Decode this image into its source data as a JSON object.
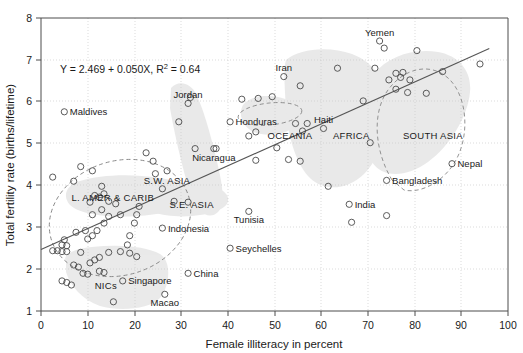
{
  "chart_data": {
    "type": "scatter",
    "title": "",
    "xlabel": "Female illiteracy in percent",
    "ylabel": "Total fertility rate (births/lifetime)",
    "xlim": [
      0,
      100
    ],
    "ylim": [
      1,
      8
    ],
    "xticks": [
      0,
      10,
      20,
      30,
      40,
      50,
      60,
      70,
      80,
      90,
      100
    ],
    "yticks": [
      1,
      2,
      3,
      4,
      5,
      6,
      7,
      8
    ],
    "grid": true,
    "legend_position": "none",
    "annotations": {
      "equation": "Y = 2.469 + 0.050X, R  = 0.64",
      "equation_plain": "Y = 2.469 + 0.050X, R2 = 0.64",
      "equation_lead": "Y = 2.469 + 0.050X, R",
      "equation_sup": "2",
      "equation_tail": " = 0.64"
    },
    "regression": {
      "intercept": 2.469,
      "slope": 0.05,
      "r_squared": 0.64,
      "x_start": 0,
      "x_end": 96
    },
    "cluster_labels": [
      {
        "text": "L. AMER & CARIB",
        "x": 6.5,
        "y": 3.62
      },
      {
        "text": "S.E. ASIA",
        "x": 27.5,
        "y": 3.45
      },
      {
        "text": "S.W. ASIA",
        "x": 22.0,
        "y": 4.03
      },
      {
        "text": "OCEANIA",
        "x": 48.5,
        "y": 5.12
      },
      {
        "text": "AFRICA",
        "x": 62.5,
        "y": 5.12
      },
      {
        "text": "SOUTH ASIA",
        "x": 77.5,
        "y": 5.12
      },
      {
        "text": "NICs",
        "x": 11.5,
        "y": 1.52
      }
    ],
    "labeled_points": [
      {
        "name": "Maldives",
        "x": 5.0,
        "y": 5.76,
        "label_side": "right"
      },
      {
        "name": "Jordan",
        "x": 31.5,
        "y": 5.96,
        "label_side": "above"
      },
      {
        "name": "Honduras",
        "x": 40.5,
        "y": 5.52,
        "label_side": "right"
      },
      {
        "name": "Iran",
        "x": 52.0,
        "y": 6.6,
        "label_side": "above"
      },
      {
        "name": "Yemen",
        "x": 72.5,
        "y": 7.45,
        "label_side": "above"
      },
      {
        "name": "Haiti",
        "x": 60.5,
        "y": 5.36,
        "label_side": "above"
      },
      {
        "name": "Nepal",
        "x": 88.0,
        "y": 4.52,
        "label_side": "right"
      },
      {
        "name": "Bangladesh",
        "x": 74.0,
        "y": 4.12,
        "label_side": "right"
      },
      {
        "name": "India",
        "x": 66.0,
        "y": 3.55,
        "label_side": "right"
      },
      {
        "name": "Nicaragua",
        "x": 37.0,
        "y": 4.88,
        "label_side": "below"
      },
      {
        "name": "Indonesia",
        "x": 26.0,
        "y": 2.98,
        "label_side": "right"
      },
      {
        "name": "Tunisia",
        "x": 44.5,
        "y": 3.38,
        "label_side": "below"
      },
      {
        "name": "Seychelles",
        "x": 40.5,
        "y": 2.5,
        "label_side": "right"
      },
      {
        "name": "Singapore",
        "x": 17.5,
        "y": 1.72,
        "label_side": "right"
      },
      {
        "name": "China",
        "x": 31.5,
        "y": 1.9,
        "label_side": "right"
      },
      {
        "name": "Macao",
        "x": 26.5,
        "y": 1.4,
        "label_side": "below"
      }
    ],
    "unlabeled_points": [
      {
        "x": 2.5,
        "y": 4.2
      },
      {
        "x": 8.5,
        "y": 4.45
      },
      {
        "x": 11.0,
        "y": 4.35
      },
      {
        "x": 7.0,
        "y": 4.1
      },
      {
        "x": 13.0,
        "y": 3.98
      },
      {
        "x": 11.5,
        "y": 3.76
      },
      {
        "x": 12.5,
        "y": 3.72
      },
      {
        "x": 13.5,
        "y": 3.8
      },
      {
        "x": 14.5,
        "y": 3.62
      },
      {
        "x": 10.5,
        "y": 3.6
      },
      {
        "x": 13.0,
        "y": 3.42
      },
      {
        "x": 16.0,
        "y": 3.56
      },
      {
        "x": 11.0,
        "y": 3.3
      },
      {
        "x": 14.5,
        "y": 3.26
      },
      {
        "x": 17.0,
        "y": 3.3
      },
      {
        "x": 13.5,
        "y": 3.1
      },
      {
        "x": 9.5,
        "y": 2.92
      },
      {
        "x": 12.0,
        "y": 2.92
      },
      {
        "x": 11.0,
        "y": 2.8
      },
      {
        "x": 10.0,
        "y": 2.72
      },
      {
        "x": 7.5,
        "y": 2.88
      },
      {
        "x": 5.0,
        "y": 2.7
      },
      {
        "x": 4.5,
        "y": 2.58
      },
      {
        "x": 5.5,
        "y": 2.56
      },
      {
        "x": 2.5,
        "y": 2.44
      },
      {
        "x": 3.5,
        "y": 2.44
      },
      {
        "x": 4.5,
        "y": 2.42
      },
      {
        "x": 5.5,
        "y": 2.42
      },
      {
        "x": 8.5,
        "y": 2.4
      },
      {
        "x": 11.5,
        "y": 2.22
      },
      {
        "x": 12.5,
        "y": 2.28
      },
      {
        "x": 14.5,
        "y": 2.4
      },
      {
        "x": 17.0,
        "y": 2.42
      },
      {
        "x": 19.0,
        "y": 2.38
      },
      {
        "x": 20.5,
        "y": 2.3
      },
      {
        "x": 18.5,
        "y": 2.58
      },
      {
        "x": 20.0,
        "y": 3.1
      },
      {
        "x": 20.5,
        "y": 3.3
      },
      {
        "x": 21.0,
        "y": 3.5
      },
      {
        "x": 19.0,
        "y": 2.8
      },
      {
        "x": 7.0,
        "y": 2.1
      },
      {
        "x": 8.0,
        "y": 2.05
      },
      {
        "x": 10.5,
        "y": 2.15
      },
      {
        "x": 9.0,
        "y": 1.9
      },
      {
        "x": 10.0,
        "y": 1.88
      },
      {
        "x": 12.5,
        "y": 1.95
      },
      {
        "x": 13.5,
        "y": 1.92
      },
      {
        "x": 4.5,
        "y": 1.72
      },
      {
        "x": 5.5,
        "y": 1.68
      },
      {
        "x": 6.5,
        "y": 1.62
      },
      {
        "x": 15.5,
        "y": 1.22
      },
      {
        "x": 24.5,
        "y": 4.28
      },
      {
        "x": 27.0,
        "y": 4.35
      },
      {
        "x": 26.0,
        "y": 3.92
      },
      {
        "x": 28.5,
        "y": 3.62
      },
      {
        "x": 31.5,
        "y": 3.6
      },
      {
        "x": 24.0,
        "y": 4.58
      },
      {
        "x": 22.5,
        "y": 4.78
      },
      {
        "x": 29.5,
        "y": 5.52
      },
      {
        "x": 32.0,
        "y": 6.1
      },
      {
        "x": 33.0,
        "y": 4.88
      },
      {
        "x": 37.5,
        "y": 4.88
      },
      {
        "x": 43.0,
        "y": 6.06
      },
      {
        "x": 46.5,
        "y": 6.08
      },
      {
        "x": 49.5,
        "y": 6.12
      },
      {
        "x": 46.0,
        "y": 5.28
      },
      {
        "x": 44.5,
        "y": 5.18
      },
      {
        "x": 46.0,
        "y": 4.6
      },
      {
        "x": 50.5,
        "y": 4.9
      },
      {
        "x": 55.5,
        "y": 6.38
      },
      {
        "x": 54.5,
        "y": 5.48
      },
      {
        "x": 57.0,
        "y": 5.48
      },
      {
        "x": 56.0,
        "y": 5.3
      },
      {
        "x": 53.0,
        "y": 4.62
      },
      {
        "x": 55.5,
        "y": 4.58
      },
      {
        "x": 61.5,
        "y": 3.98
      },
      {
        "x": 66.5,
        "y": 3.12
      },
      {
        "x": 63.5,
        "y": 6.8
      },
      {
        "x": 69.0,
        "y": 6.02
      },
      {
        "x": 71.5,
        "y": 6.8
      },
      {
        "x": 73.5,
        "y": 7.28
      },
      {
        "x": 74.5,
        "y": 6.52
      },
      {
        "x": 76.0,
        "y": 6.68
      },
      {
        "x": 77.5,
        "y": 6.7
      },
      {
        "x": 77.0,
        "y": 6.58
      },
      {
        "x": 76.0,
        "y": 6.3
      },
      {
        "x": 79.0,
        "y": 6.52
      },
      {
        "x": 78.5,
        "y": 6.22
      },
      {
        "x": 80.5,
        "y": 7.22
      },
      {
        "x": 82.5,
        "y": 6.2
      },
      {
        "x": 86.0,
        "y": 6.72
      },
      {
        "x": 94.0,
        "y": 6.9
      },
      {
        "x": 74.0,
        "y": 3.28
      },
      {
        "x": 70.5,
        "y": 5.02
      }
    ],
    "shaded_regions": [
      "latin-america-caribbean-blob",
      "nics-blob",
      "se-asia-blob",
      "sw-asia-blob",
      "oceania-blob",
      "africa-blob",
      "south-asia-blob"
    ],
    "dashed_ellipses": [
      "latin-america-ellipse",
      "oceania-ellipse",
      "south-asia-ellipse"
    ]
  }
}
